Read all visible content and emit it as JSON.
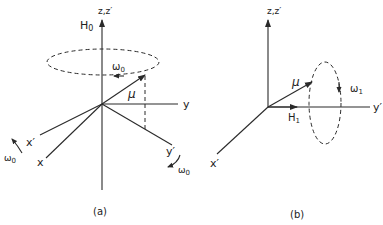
{
  "figure": {
    "panel_a": {
      "caption": "(a)",
      "z_axis_label": "z,z′",
      "field_label": "H",
      "field_sub": "0",
      "omega_label": "ω",
      "omega_sub": "0",
      "mu_label": "μ",
      "y_label": "y",
      "y_prime_label": "y′",
      "x_label": "x",
      "x_prime_label": "x′",
      "omega_x_label": "ω",
      "omega_x_sub": "0",
      "omega_y_label": "ω",
      "omega_y_sub": "0"
    },
    "panel_b": {
      "caption": "(b)",
      "z_axis_label": "z,z′",
      "y_prime_label": "y′",
      "x_prime_label": "x′",
      "mu_label": "μ",
      "field_label": "H",
      "field_sub": "1",
      "omega_label": "ω",
      "omega_sub": "1"
    }
  }
}
